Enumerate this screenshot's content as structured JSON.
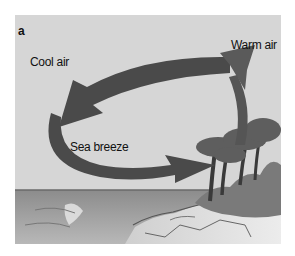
{
  "figure": {
    "panel_label": "a",
    "labels": {
      "cool_air": "Cool air",
      "warm_air": "Warm air",
      "sea_breeze": "Sea breeze"
    },
    "colors": {
      "sky": "#d6d6d6",
      "arrow": "#4a4a4a",
      "sea": "#9a9a9a",
      "land": "#e4e4e4",
      "trees": "#5a5a5a"
    }
  }
}
